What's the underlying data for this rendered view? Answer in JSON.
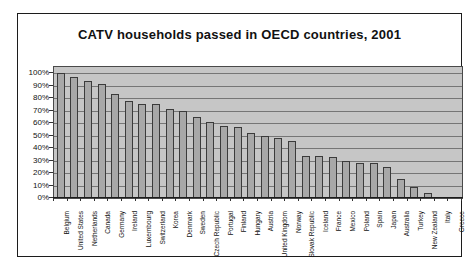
{
  "title": "CATV households passed in OECD countries, 2001",
  "chart_data": {
    "type": "bar",
    "title": "CATV households passed in OECD countries, 2001",
    "xlabel": "",
    "ylabel": "",
    "ylim": [
      0,
      105
    ],
    "grid": true,
    "legend": false,
    "ytick_labels": [
      "0%",
      "10%",
      "20%",
      "30%",
      "40%",
      "50%",
      "60%",
      "70%",
      "80%",
      "90%",
      "100%"
    ],
    "categories": [
      "Belgium",
      "United States",
      "Netherlands",
      "Canada",
      "Germany",
      "Ireland",
      "Luxembourg",
      "Switzerland",
      "Korea",
      "Denmark",
      "Sweden",
      "Czech Republic",
      "Portugal",
      "Finland",
      "Hungary",
      "Austria",
      "United Kingdom",
      "Norway",
      "Slovak Republic",
      "Iceland",
      "France",
      "Mexico",
      "Poland",
      "Spain",
      "Japan",
      "Australia",
      "Turkey",
      "New Zealand",
      "Italy",
      "Greece"
    ],
    "values": [
      100,
      97,
      94,
      91,
      83,
      78,
      75,
      75,
      71,
      70,
      65,
      61,
      58,
      57,
      52,
      50,
      48,
      46,
      34,
      34,
      33,
      30,
      28,
      28,
      25,
      15,
      9,
      4,
      1,
      0
    ],
    "colors": {
      "page_bg": "#ffffff",
      "plot_bg": "#c6c6c6",
      "bar_fill": "#a8a8a8",
      "bar_border": "#3b3b3b",
      "gridline": "#767676",
      "frame_border": "#1c1c1c"
    }
  }
}
